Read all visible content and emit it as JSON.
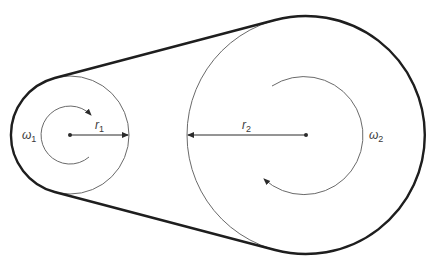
{
  "diagram": {
    "colors": {
      "belt": "#1e1e1e",
      "pulley": "#6a6a6a",
      "arrow": "#2b2b2b",
      "label": "#3a3a3a"
    },
    "small_pulley": {
      "center": [
        70,
        135
      ],
      "radius": 59,
      "radius_label": {
        "symbol": "r",
        "subscript": "1"
      },
      "angular_velocity_label": {
        "symbol": "ω",
        "subscript": "1"
      },
      "rotation": "clockwise"
    },
    "large_pulley": {
      "center": [
        306,
        135
      ],
      "radius": 119,
      "radius_label": {
        "symbol": "r",
        "subscript": "2"
      },
      "angular_velocity_label": {
        "symbol": "ω",
        "subscript": "2"
      },
      "rotation": "clockwise"
    },
    "belt": {
      "description": "Open belt wrapping both pulleys along outer tangent lines"
    }
  }
}
